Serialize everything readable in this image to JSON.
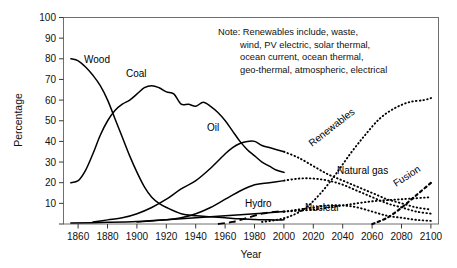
{
  "chart_data": {
    "type": "line",
    "title": "",
    "xlabel": "Year",
    "ylabel": "Percentage",
    "xlim": [
      1850,
      2105
    ],
    "ylim": [
      0,
      100
    ],
    "grid": false,
    "legend_position": "inline-labels",
    "xticks": [
      1860,
      1880,
      1900,
      1920,
      1940,
      1960,
      1980,
      2000,
      2020,
      2040,
      2060,
      2080,
      2100
    ],
    "yticks": [
      0,
      10,
      20,
      30,
      40,
      50,
      60,
      70,
      80,
      90,
      100
    ],
    "annotation": "Note: Renewables include, waste, wind, PV electric, solar thermal, ocean current, ocean thermal, geo-thermal, atmospheric, electrical",
    "series": [
      {
        "name": "Wood",
        "style": "solid",
        "x": [
          1855,
          1860,
          1865,
          1870,
          1875,
          1880,
          1885,
          1890,
          1895,
          1900,
          1905,
          1910,
          1915,
          1920,
          1930,
          1940,
          1950,
          1960,
          1970,
          1980,
          1990,
          2000
        ],
        "values": [
          80,
          79,
          76,
          72,
          67,
          60,
          51,
          42,
          33,
          25,
          18,
          13,
          10,
          8,
          5,
          4,
          3.5,
          3,
          2.5,
          2.2,
          2,
          2
        ]
      },
      {
        "name": "Coal",
        "style": "solid",
        "x": [
          1855,
          1860,
          1865,
          1870,
          1875,
          1880,
          1885,
          1890,
          1895,
          1900,
          1905,
          1910,
          1915,
          1920,
          1925,
          1930,
          1935,
          1940,
          1945,
          1950,
          1955,
          1960,
          1965,
          1970,
          1975,
          1980,
          1985,
          1990,
          1995,
          2000
        ],
        "values": [
          20,
          21,
          26,
          34,
          43,
          50,
          55,
          58,
          60,
          63,
          66,
          67,
          66,
          64,
          63,
          58,
          58,
          57,
          59,
          57,
          54,
          50,
          45,
          40,
          36,
          33,
          30,
          28,
          26,
          25
        ]
      },
      {
        "name": "Oil",
        "style": "solid",
        "x": [
          1870,
          1880,
          1890,
          1900,
          1910,
          1920,
          1930,
          1940,
          1950,
          1960,
          1965,
          1970,
          1975,
          1980,
          1985,
          1990,
          1995,
          2000
        ],
        "values": [
          1,
          2,
          3,
          5,
          8,
          12,
          17,
          21,
          27,
          34,
          37,
          39,
          40,
          40,
          38,
          37,
          36,
          35
        ]
      },
      {
        "name": "Oil future",
        "style": "dotted",
        "x": [
          2000,
          2010,
          2020,
          2030,
          2040,
          2050,
          2060,
          2070,
          2080,
          2090,
          2100
        ],
        "values": [
          35,
          32,
          28,
          24,
          21,
          18,
          15,
          12,
          10,
          8,
          7
        ]
      },
      {
        "name": "Natural gas",
        "style": "solid",
        "x": [
          1900,
          1910,
          1920,
          1930,
          1940,
          1950,
          1960,
          1970,
          1980,
          1990,
          2000
        ],
        "values": [
          1,
          1.5,
          2,
          3,
          5,
          8,
          12,
          16,
          19,
          20,
          21
        ]
      },
      {
        "name": "Natural gas future",
        "style": "dotted",
        "x": [
          2000,
          2010,
          2020,
          2030,
          2040,
          2050,
          2060,
          2070,
          2080,
          2090,
          2100
        ],
        "values": [
          21,
          22,
          22,
          21,
          19,
          16,
          13,
          10,
          8,
          6,
          5
        ]
      },
      {
        "name": "Hydro",
        "style": "solid",
        "x": [
          1855,
          1880,
          1900,
          1920,
          1940,
          1960,
          1980,
          2000
        ],
        "values": [
          0.5,
          0.8,
          1.2,
          2,
          3,
          4,
          5,
          6
        ]
      },
      {
        "name": "Hydro future",
        "style": "dotted",
        "x": [
          2000,
          2020,
          2040,
          2060,
          2080,
          2100
        ],
        "values": [
          6,
          7,
          9,
          11,
          12,
          13
        ]
      },
      {
        "name": "Nuclear",
        "style": "dashed",
        "x": [
          1955,
          1965,
          1975,
          1985,
          1995,
          2000
        ],
        "values": [
          0,
          1,
          3,
          5,
          6,
          6
        ]
      },
      {
        "name": "Nuclear future",
        "style": "dotted",
        "x": [
          2000,
          2010,
          2020,
          2030,
          2040,
          2050,
          2060,
          2070,
          2080,
          2090,
          2100
        ],
        "values": [
          6,
          7,
          8,
          9,
          9,
          8,
          6,
          4,
          3,
          2,
          1.5
        ]
      },
      {
        "name": "Renewables",
        "style": "dotted",
        "x": [
          1985,
          1995,
          2005,
          2015,
          2025,
          2035,
          2045,
          2055,
          2065,
          2075,
          2085,
          2095,
          2100
        ],
        "values": [
          1,
          2,
          4,
          8,
          15,
          24,
          34,
          43,
          51,
          56,
          59,
          60,
          61
        ]
      },
      {
        "name": "Fusion",
        "style": "dotted-bold",
        "x": [
          2060,
          2070,
          2080,
          2090,
          2100
        ],
        "values": [
          0,
          3,
          8,
          14,
          20
        ]
      }
    ],
    "curve_labels": [
      {
        "text": "Wood",
        "rotation": 0
      },
      {
        "text": "Coal",
        "rotation": 0
      },
      {
        "text": "Oil",
        "rotation": 0
      },
      {
        "text": "Hydro",
        "rotation": 0
      },
      {
        "text": "Nuclear",
        "rotation": 0
      },
      {
        "text": "Natural gas",
        "rotation": 0
      },
      {
        "text": "Renewables",
        "rotation": -38
      },
      {
        "text": "Fusion",
        "rotation": -33
      }
    ],
    "note_lines": [
      "Note: Renewables include, waste,",
      "wind, PV electric, solar thermal,",
      "ocean current, ocean thermal,",
      "geo-thermal, atmospheric, electrical"
    ]
  }
}
